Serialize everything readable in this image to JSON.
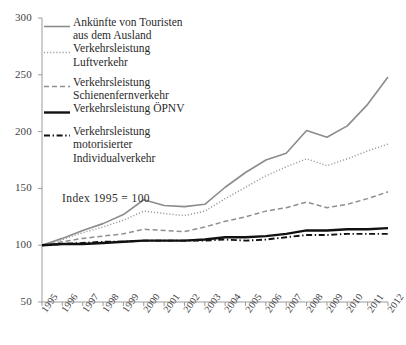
{
  "chart_data": {
    "type": "line",
    "title": "",
    "subtitle": "",
    "annotation": "Index 1995 = 100",
    "xlabel": "",
    "ylabel": "",
    "grid": false,
    "legend_position": "top-left",
    "x": [
      1995,
      1996,
      1997,
      1998,
      1999,
      2000,
      2001,
      2002,
      2003,
      2004,
      2005,
      2006,
      2007,
      2008,
      2009,
      2010,
      2011,
      2012
    ],
    "xtick_labels": [
      "1995",
      "1996",
      "1997",
      "1998",
      "1999",
      "2000",
      "2001",
      "2002",
      "2003",
      "2004",
      "2005",
      "2006",
      "2007",
      "2008",
      "2009",
      "2010",
      "2011",
      "2012"
    ],
    "ytick_labels": [
      "50",
      "100",
      "150",
      "200",
      "250",
      "300"
    ],
    "ytick_values": [
      50,
      100,
      150,
      200,
      250,
      300
    ],
    "ylim": [
      50,
      300
    ],
    "xlim": [
      1995,
      2012
    ],
    "series": [
      {
        "name": "Ankünfte von Touristen aus dem Ausland",
        "legend_label": "Ankünfte von Touristen\naus dem Ausland",
        "style": "solid",
        "color": "#8c8c8c",
        "width": 1.6,
        "values": [
          100,
          106,
          113,
          119,
          127,
          140,
          135,
          134,
          136,
          151,
          164,
          175,
          181,
          201,
          195,
          205,
          224,
          248
        ]
      },
      {
        "name": "Verkehrsleistung Luftverkehr",
        "legend_label": "Verkehrsleistung\nLuftverkehr",
        "style": "dotted",
        "color": "#9a9a9a",
        "width": 1.5,
        "values": [
          100,
          105,
          111,
          116,
          122,
          130,
          128,
          126,
          130,
          141,
          151,
          161,
          169,
          176,
          170,
          176,
          183,
          189
        ]
      },
      {
        "name": "Verkehrsleistung Schienenfernverkehr",
        "legend_label": "Verkehrsleistung\nSchienenfernverkehr",
        "style": "dashed",
        "color": "#8f8f8f",
        "width": 1.5,
        "values": [
          100,
          103,
          106,
          108,
          110,
          114,
          113,
          112,
          116,
          121,
          125,
          130,
          133,
          138,
          133,
          136,
          141,
          147
        ]
      },
      {
        "name": "Verkehrsleistung ÖPNV",
        "legend_label": "Verkehrsleistung ÖPNV",
        "style": "solid",
        "color": "#111111",
        "width": 2.4,
        "values": [
          100,
          101,
          101,
          102,
          103,
          104,
          104,
          104,
          105,
          107,
          107,
          108,
          110,
          113,
          113,
          114,
          114,
          115
        ]
      },
      {
        "name": "Verkehrsleistung motorisierter Individualverkehr",
        "legend_label": "Verkehrsleistung\nmotorisierter\nIndividualverkehr",
        "style": "dashdot",
        "color": "#111111",
        "width": 1.9,
        "values": [
          100,
          101,
          102,
          103,
          103,
          104,
          104,
          104,
          104,
          105,
          104,
          105,
          107,
          109,
          109,
          110,
          110,
          110
        ]
      }
    ]
  },
  "axes": {
    "y_axis_name": "index-axis",
    "x_axis_name": "year-axis"
  }
}
